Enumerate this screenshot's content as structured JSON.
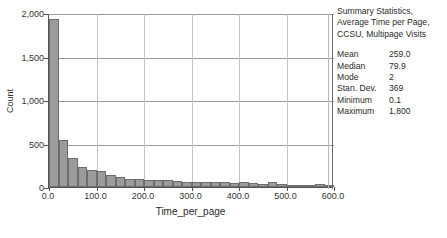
{
  "chart_data": {
    "type": "bar",
    "title": "",
    "xlabel": "Time_per_page",
    "ylabel": "Count",
    "xlim": [
      0,
      600
    ],
    "ylim": [
      0,
      2000
    ],
    "xticks": [
      "0.0",
      "100.0",
      "200.0",
      "300.0",
      "400.0",
      "500.0",
      "600.0"
    ],
    "xtick_values": [
      0,
      100,
      200,
      300,
      400,
      500,
      600
    ],
    "yticks": [
      "0",
      "500",
      "1,000",
      "1,500",
      "2,000"
    ],
    "ytick_values": [
      0,
      500,
      1000,
      1500,
      2000
    ],
    "grid": "horizontal and vertical gridlines at tick positions",
    "legend": "none",
    "bin_width": 20,
    "bin_starts": [
      0,
      20,
      40,
      60,
      80,
      100,
      120,
      140,
      160,
      180,
      200,
      220,
      240,
      260,
      280,
      300,
      320,
      340,
      360,
      380,
      400,
      420,
      440,
      460,
      480,
      500,
      520,
      540,
      560,
      580
    ],
    "values": [
      1930,
      545,
      330,
      235,
      200,
      180,
      140,
      115,
      95,
      90,
      85,
      85,
      80,
      65,
      60,
      60,
      55,
      55,
      55,
      50,
      55,
      45,
      40,
      60,
      30,
      25,
      25,
      25,
      38,
      25
    ],
    "bar_color": "#9b9b9b",
    "bar_edge_color": "#6d6d6d"
  },
  "stats_panel": {
    "title_lines": [
      "Summary Statistics,",
      "Average Time per Page,",
      "CCSU, Multipage Visits"
    ],
    "rows": [
      {
        "label": "Mean",
        "value": "259.0"
      },
      {
        "label": "Median",
        "value": "79.9"
      },
      {
        "label": "Mode",
        "value": "2"
      },
      {
        "label": "Stan. Dev.",
        "value": "369"
      },
      {
        "label": "Minimum",
        "value": "0.1"
      },
      {
        "label": "Maximum",
        "value": "1,800"
      }
    ]
  }
}
